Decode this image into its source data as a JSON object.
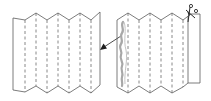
{
  "diagram": {
    "type": "paper-folding-instructions",
    "colors": {
      "outline": "#5a5a5a",
      "fold_line": "#6a6a6a",
      "cut_shape": "#a8a8a8",
      "arrow": "#1e1e1e",
      "background": "#ffffff"
    },
    "panels": [
      {
        "name": "accordion-folded-strip",
        "fold_lines": 6,
        "description": "Zigzag accordion-folded paper strip with dashed fold lines"
      },
      {
        "name": "strip-with-cut-outline",
        "fold_lines": 5,
        "description": "Folded strip with wavy cut outline along left edge and scissors at top right"
      }
    ],
    "icons": [
      "arrow-left-down-icon",
      "scissors-icon"
    ]
  }
}
